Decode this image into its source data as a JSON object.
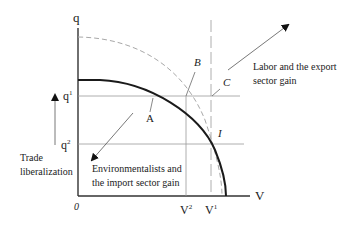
{
  "axes": {
    "y_label": "q",
    "x_label": "V",
    "origin_label": "0",
    "q1": {
      "base": "q",
      "sup": "1"
    },
    "q2": {
      "base": "q",
      "sup": "2"
    },
    "v1": {
      "base": "V",
      "sup": "1"
    },
    "v2": {
      "base": "V",
      "sup": "2"
    }
  },
  "points": {
    "a": "A",
    "b": "B",
    "c": "C",
    "i": "I"
  },
  "annotations": {
    "labor_line1": "Labor and the export",
    "labor_line2": "sector gain",
    "env_line1": "Environmentalists and",
    "env_line2": "the import sector gain",
    "trade_line1": "Trade",
    "trade_line2": "liberalization"
  },
  "colors": {
    "curve": "#1a1a1a",
    "dashed": "#a8a8a8",
    "grid": "#9a9a9a",
    "axis": "#333333"
  }
}
